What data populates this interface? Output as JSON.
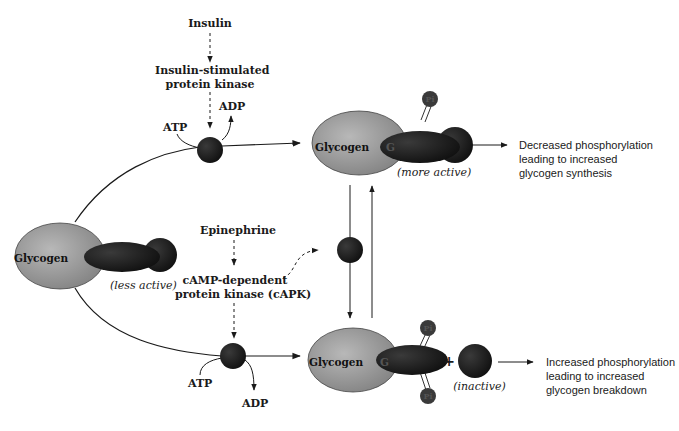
{
  "diagram": {
    "colors": {
      "glycogen_fill": "#9a9a9a",
      "enzyme_fill": "#1c1c1c",
      "phosphate_fill": "#3a3a3a",
      "line": "#1a1a1a",
      "background": "#ffffff"
    },
    "signals": {
      "insulin": "Insulin",
      "insulin_kinase_line1": "Insulin-stimulated",
      "insulin_kinase_line2": "protein kinase",
      "epinephrine": "Epinephrine",
      "capk_line1": "cAMP-dependent",
      "capk_line2": "protein kinase (cAPK)"
    },
    "cofactors": {
      "top_atp": "ATP",
      "top_adp": "ADP",
      "bottom_atp": "ATP",
      "bottom_adp": "ADP"
    },
    "complexes": {
      "left": {
        "glycogen": "Glycogen",
        "state": "(less active)"
      },
      "top_right": {
        "glycogen": "Glycogen",
        "enzyme_letter": "G",
        "phosphate": "Pi",
        "state": "(more active)"
      },
      "bottom_right": {
        "glycogen": "Glycogen",
        "enzyme_letter": "G",
        "phosphate_top": "Pi",
        "phosphate_bottom": "Pi",
        "plus": "+",
        "state": "(inactive)"
      }
    },
    "outcomes": {
      "top_line1": "Decreased phosphorylation",
      "top_line2": "leading to increased",
      "top_line3": "glycogen synthesis",
      "bottom_line1": "Increased phosphorylation",
      "bottom_line2": "leading to increased",
      "bottom_line3": "glycogen breakdown"
    }
  }
}
